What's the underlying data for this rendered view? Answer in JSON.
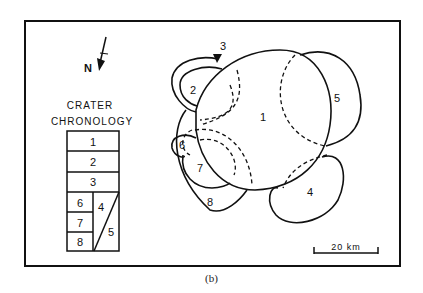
{
  "figure": {
    "caption": "(b)",
    "north_label": "N",
    "legend": {
      "title_line1": "CRATER",
      "title_line2": "CHRONOLOGY",
      "rows": [
        "1",
        "2",
        "3"
      ],
      "left_column": [
        "6",
        "7",
        "8"
      ],
      "diagonal_upper": "4",
      "diagonal_lower": "5"
    },
    "craters": [
      {
        "id": "1",
        "label": "1"
      },
      {
        "id": "2",
        "label": "2"
      },
      {
        "id": "3",
        "label": "3"
      },
      {
        "id": "4",
        "label": "4"
      },
      {
        "id": "5",
        "label": "5"
      },
      {
        "id": "6",
        "label": "6"
      },
      {
        "id": "7",
        "label": "7"
      },
      {
        "id": "8",
        "label": "8"
      }
    ],
    "scale_bar": {
      "label": "20 km"
    }
  }
}
